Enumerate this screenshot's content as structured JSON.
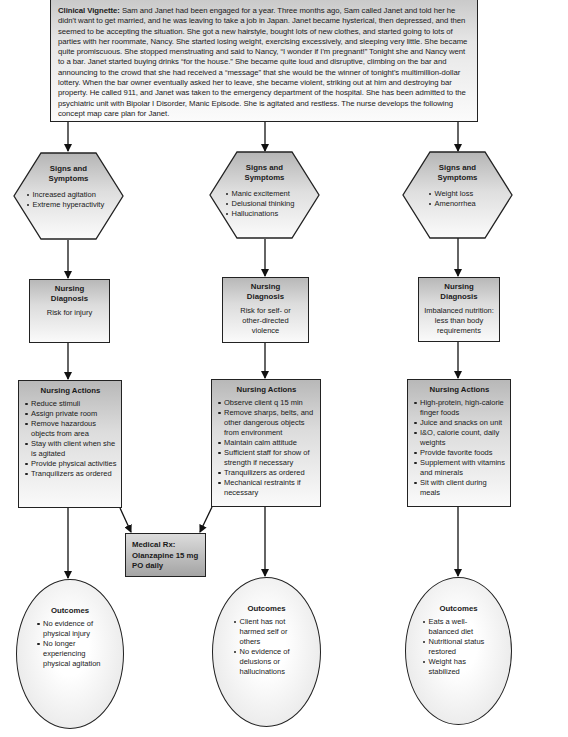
{
  "vignette": {
    "label": "Clinical Vignette:",
    "text": " Sam and Janet had been engaged for a year. Three months ago, Sam called Janet and told her he didn't want to get married, and he was leaving to take a job in Japan. Janet became hysterical, then depressed, and then seemed to be accepting the situation. She got a new hairstyle, bought lots of new clothes, and started going to lots of parties with her roommate, Nancy. She started losing weight, exercising excessively, and sleeping very little. She became quite promiscuous. She stopped menstruating and said to Nancy, “I wonder if I'm pregnant!” Tonight she and Nancy went to a bar. Janet started buying drinks “for the house.” She became quite loud and disruptive, climbing on the bar and announcing to the crowd that she had received a “message” that she would be the winner of tonight's multimillion-dollar lottery. When the bar owner eventually asked her to leave, she became violent, striking out at him and destroying bar property. He called 911, and Janet was taken to the emergency department of the hospital. She has been admitted to the psychiatric unit with Bipolar I Disorder, Manic Episode. She is agitated and restless. The nurse develops the following concept map care plan for Janet."
  },
  "columns": [
    {
      "signs": {
        "title_1": "Signs and",
        "title_2": "Symptoms",
        "items": [
          "Increased agitation",
          "Extreme hyperactivity"
        ]
      },
      "diagnosis": {
        "title_1": "Nursing",
        "title_2": "Diagnosis",
        "text": "Risk for injury"
      },
      "actions": {
        "title": "Nursing Actions",
        "items": [
          "Reduce stimuli",
          "Assign private room",
          "Remove hazardous objects from area",
          "Stay with client when she is agitated",
          "Provide physical activities",
          "Tranquilizers as ordered"
        ]
      },
      "outcomes": {
        "title": "Outcomes",
        "items": [
          "No evidence of physical injury",
          "No longer experiencing physical agitation"
        ]
      }
    },
    {
      "signs": {
        "title_1": "Signs and",
        "title_2": "Symptoms",
        "items": [
          "Manic excitement",
          "Delusional thinking",
          "Hallucinations"
        ]
      },
      "diagnosis": {
        "title_1": "Nursing",
        "title_2": "Diagnosis",
        "text": "Risk for self- or other-directed violence"
      },
      "actions": {
        "title": "Nursing Actions",
        "items": [
          "Observe client q 15 min",
          "Remove sharps, belts, and other dangerous objects from environment",
          "Maintain calm attitude",
          "Sufficient staff for show of strength if necessary",
          "Tranquilizers as ordered",
          "Mechanical restraints if necessary"
        ]
      },
      "outcomes": {
        "title": "Outcomes",
        "items": [
          "Client has not harmed self or others",
          "No evidence of delusions or hallucinations"
        ]
      }
    },
    {
      "signs": {
        "title_1": "Signs and",
        "title_2": "Symptoms",
        "items": [
          "Weight loss",
          "Amenorrhea"
        ]
      },
      "diagnosis": {
        "title_1": "Nursing",
        "title_2": "Diagnosis",
        "text": "Imbalanced nutrition: less than body requirements"
      },
      "actions": {
        "title": "Nursing Actions",
        "items": [
          "High-protein, high-calorie finger foods",
          "Juice and snacks on unit",
          "I&O, calorie count, daily weights",
          "Provide favorite foods",
          "Supplement with vitamins and minerals",
          "Sit with client during meals"
        ]
      },
      "outcomes": {
        "title": "Outcomes",
        "items": [
          "Eats a well-balanced diet",
          "Nutritional status restored",
          "Weight has stabilized"
        ]
      }
    }
  ],
  "medical_rx": {
    "line_1": "Medical Rx:",
    "line_2": "Olanzapine 15 mg",
    "line_3": "PO daily"
  },
  "colors": {
    "stroke": "#222222",
    "fill_dark": "#b8b8b8",
    "fill_light": "#fafafa"
  }
}
